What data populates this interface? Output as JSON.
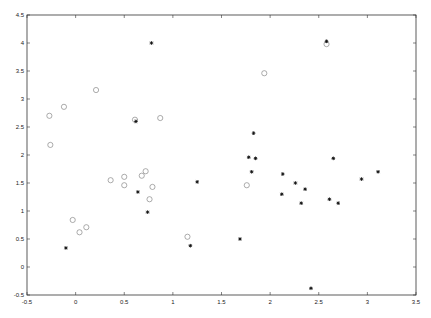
{
  "chart_data": {
    "type": "scatter",
    "title": "",
    "xlabel": "",
    "ylabel": "",
    "xlim": [
      -0.5,
      3.5
    ],
    "ylim": [
      -0.5,
      4.5
    ],
    "xticks": [
      "-0.5",
      "0",
      "0.5",
      "1",
      "1.5",
      "2",
      "2.5",
      "3",
      "3.5"
    ],
    "yticks": [
      "-0.5",
      "0",
      "0.5",
      "1",
      "1.5",
      "2",
      "2.5",
      "3",
      "3.5",
      "4",
      "4.5"
    ],
    "grid": false,
    "legend": null,
    "series": [
      {
        "name": "circles",
        "marker": "o",
        "color": "#888888",
        "points": [
          [
            0.21,
            3.16
          ],
          [
            -0.12,
            2.86
          ],
          [
            -0.27,
            2.7
          ],
          [
            0.61,
            2.63
          ],
          [
            0.87,
            2.66
          ],
          [
            -0.26,
            2.18
          ],
          [
            0.36,
            1.55
          ],
          [
            0.5,
            1.61
          ],
          [
            0.5,
            1.46
          ],
          [
            0.68,
            1.63
          ],
          [
            0.72,
            1.71
          ],
          [
            0.79,
            1.43
          ],
          [
            0.76,
            1.21
          ],
          [
            -0.03,
            0.84
          ],
          [
            0.11,
            0.71
          ],
          [
            0.04,
            0.62
          ],
          [
            1.15,
            0.54
          ],
          [
            1.76,
            1.46
          ],
          [
            1.94,
            3.46
          ],
          [
            2.58,
            3.98
          ]
        ]
      },
      {
        "name": "stars",
        "marker": "*",
        "color": "#111111",
        "points": [
          [
            0.78,
            4.0
          ],
          [
            0.62,
            2.6
          ],
          [
            0.64,
            1.34
          ],
          [
            0.74,
            0.98
          ],
          [
            -0.1,
            0.34
          ],
          [
            1.25,
            1.52
          ],
          [
            1.18,
            0.38
          ],
          [
            1.69,
            0.5
          ],
          [
            2.58,
            4.03
          ],
          [
            1.83,
            2.39
          ],
          [
            1.78,
            1.96
          ],
          [
            1.85,
            1.94
          ],
          [
            2.65,
            1.94
          ],
          [
            1.81,
            1.7
          ],
          [
            2.13,
            1.66
          ],
          [
            2.26,
            1.5
          ],
          [
            2.36,
            1.39
          ],
          [
            2.12,
            1.3
          ],
          [
            2.32,
            1.14
          ],
          [
            2.61,
            1.21
          ],
          [
            2.7,
            1.14
          ],
          [
            2.94,
            1.57
          ],
          [
            3.11,
            1.7
          ],
          [
            2.42,
            -0.38
          ]
        ]
      }
    ]
  }
}
